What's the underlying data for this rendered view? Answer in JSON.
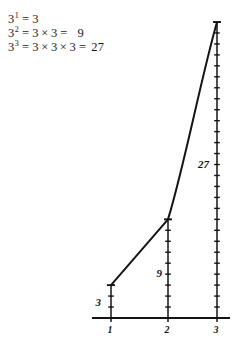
{
  "equations": [
    {
      "base": "3",
      "exponent": "1",
      "eq": "=",
      "factors": [
        "3"
      ],
      "result": "3",
      "show_result_eq": false
    },
    {
      "base": "3",
      "exponent": "2",
      "eq": "=",
      "factors": [
        "3",
        "3"
      ],
      "result": "9",
      "show_result_eq": true
    },
    {
      "base": "3",
      "exponent": "3",
      "eq": "=",
      "factors": [
        "3",
        "3",
        "3"
      ],
      "result": "27",
      "show_result_eq": true
    }
  ],
  "symbols": {
    "times": "×",
    "equals": "="
  },
  "chart_data": {
    "type": "bar",
    "title": "",
    "subtitle": "",
    "xlabel": "",
    "ylabel": "",
    "categories": [
      "1",
      "2",
      "3"
    ],
    "values": [
      3,
      9,
      27
    ],
    "value_labels": [
      "3",
      "9",
      "27"
    ],
    "tick_unit": 1,
    "ylim": [
      0,
      27
    ],
    "grid": false,
    "legend": null,
    "annotations": [
      {
        "text": "3",
        "for_category": "1"
      },
      {
        "text": "9",
        "for_category": "2"
      },
      {
        "text": "27",
        "for_category": "3"
      }
    ],
    "overlay_line": {
      "type": "curve",
      "through_points": [
        [
          1,
          3
        ],
        [
          2,
          9
        ],
        [
          3,
          27
        ]
      ]
    },
    "axis": {
      "baseline_visible": true,
      "tick_labels": [
        "1",
        "2",
        "3"
      ]
    }
  },
  "colors": {
    "ink": "#141414",
    "background": "#ffffff"
  }
}
